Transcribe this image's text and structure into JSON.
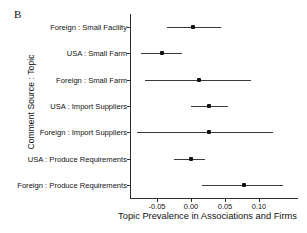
{
  "panel": {
    "label": "B"
  },
  "axes": {
    "y_title": "Comment Source : Topic",
    "x_title": "Topic Prevalence in Associations and Firms",
    "x_tick_labels": [
      "-0.05",
      "0.00",
      "0.05",
      "0.10"
    ]
  },
  "chart_data": {
    "type": "scatter",
    "title": "B",
    "xlabel": "Topic Prevalence in Associations and Firms",
    "ylabel": "Comment Source : Topic",
    "xlim": [
      -0.085,
      0.145
    ],
    "xticks": [
      -0.05,
      0.0,
      0.05,
      0.1
    ],
    "xtick_labels": [
      "-0.05",
      "0.00",
      "0.05",
      "0.10"
    ],
    "grid": false,
    "legend": "none",
    "orientation": "horizontal",
    "error_bars": "confidence-interval",
    "categories": [
      "Foreign : Small Facility",
      "USA : Small Farm",
      "Foreign : Small Farm",
      "USA : Import Suppliers",
      "Foreign : Import Suppliers",
      "USA : Produce Requirements",
      "Foreign : Produce Requirements"
    ],
    "points": [
      {
        "label": "Foreign : Small Facility",
        "estimate": 0.003,
        "ci_low": -0.035,
        "ci_high": 0.044
      },
      {
        "label": "USA : Small Farm",
        "estimate": -0.043,
        "ci_low": -0.074,
        "ci_high": -0.013
      },
      {
        "label": "Foreign : Small Farm",
        "estimate": 0.012,
        "ci_low": -0.068,
        "ci_high": 0.088
      },
      {
        "label": "USA : Import Suppliers",
        "estimate": 0.027,
        "ci_low": 0.0,
        "ci_high": 0.055
      },
      {
        "label": "Foreign : Import Suppliers",
        "estimate": 0.027,
        "ci_low": -0.079,
        "ci_high": 0.12
      },
      {
        "label": "USA : Produce Requirements",
        "estimate": 0.0,
        "ci_low": -0.025,
        "ci_high": 0.021
      },
      {
        "label": "Foreign : Produce Requirements",
        "estimate": 0.078,
        "ci_low": 0.016,
        "ci_high": 0.135
      }
    ]
  },
  "colors": {
    "point": "#111111",
    "line": "#3a3a3a",
    "axis": "#2b2b2b",
    "background": "#ffffff"
  }
}
